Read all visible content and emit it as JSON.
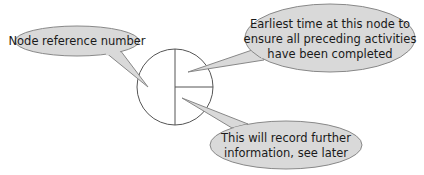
{
  "diagram": {
    "node": {
      "center": [
        175,
        87
      ],
      "radius": 38,
      "stroke": "#555555",
      "fill": "#ffffff"
    },
    "callout_style": {
      "fill": "#d9d9d9",
      "stroke": "#888888"
    },
    "callouts": [
      {
        "id": "node-reference",
        "lines": [
          "Node reference number"
        ]
      },
      {
        "id": "earliest-time",
        "lines": [
          "Earliest time at this node to",
          "ensure all preceding activities",
          "have been completed"
        ]
      },
      {
        "id": "further-info",
        "lines": [
          "This will record further",
          "information, see later"
        ]
      }
    ]
  }
}
